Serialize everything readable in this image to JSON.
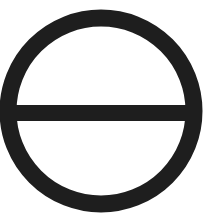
{
  "symbol": {
    "name": "circle-with-horizontal-bar",
    "stroke_color": "#1e1e1e",
    "background_color": "#ffffff",
    "circle": {
      "cx": 101,
      "cy": 111,
      "r": 93,
      "stroke_width": 17
    },
    "bar": {
      "x1": 8,
      "x2": 194,
      "y": 113,
      "stroke_width": 16
    }
  }
}
